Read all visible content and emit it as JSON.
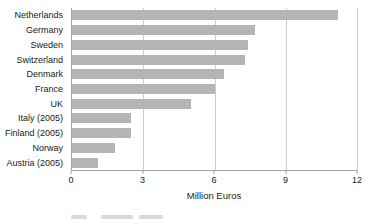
{
  "chart_data": {
    "type": "bar",
    "orientation": "horizontal",
    "title": "",
    "xlabel": "Million Euros",
    "ylabel": "",
    "categories": [
      "Netherlands",
      "Germany",
      "Sweden",
      "Switzerland",
      "Denmark",
      "France",
      "UK",
      "Italy (2005)",
      "Finland (2005)",
      "Norway",
      "Austria (2005)"
    ],
    "values": [
      11.2,
      7.7,
      7.4,
      7.3,
      6.4,
      6.0,
      5.0,
      2.5,
      2.5,
      1.8,
      1.1
    ],
    "xlim": [
      0,
      12
    ],
    "xticks": [
      0,
      3,
      6,
      9,
      12
    ],
    "grid": "vertical-at-3-6-9-plus-right-border-12",
    "legend": "none"
  },
  "styles": {
    "bar_color": "#b5b5b5",
    "gridline_color": "#cccccc",
    "axis_color": "#a3a3a3",
    "text_color": "#1a1a1a",
    "background_color": "#ffffff"
  }
}
